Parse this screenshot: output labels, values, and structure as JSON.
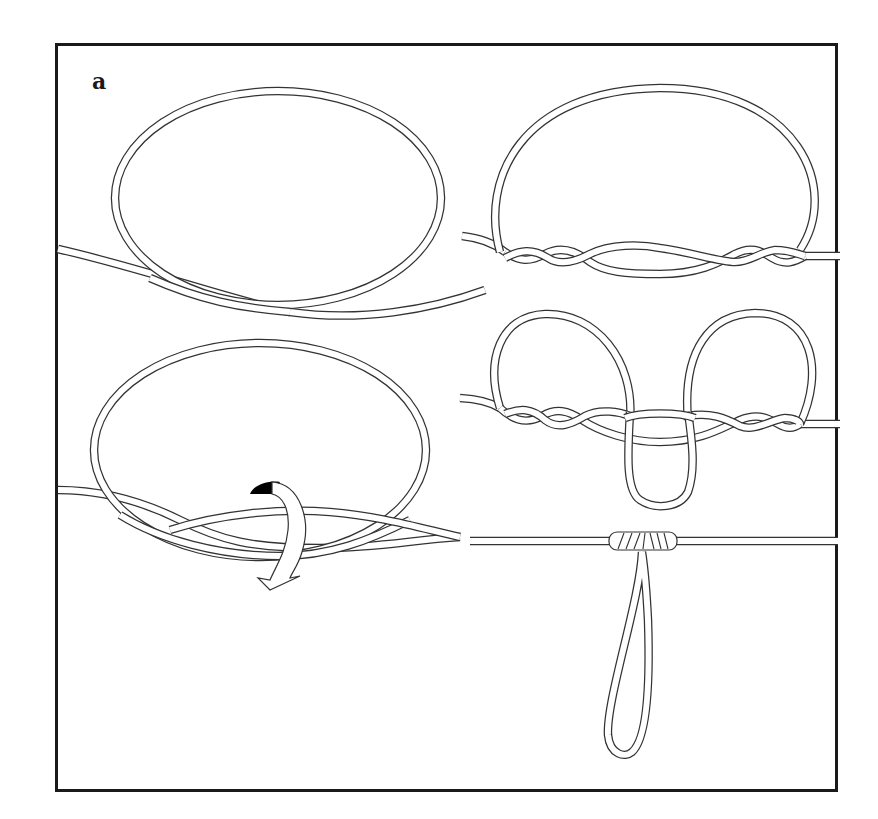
{
  "figure": {
    "panel_label": "a",
    "colors": {
      "frame": "#1a1a1a",
      "rope_outline": "#333333",
      "rope_fill": "#ffffff",
      "arrow_fill": "#ffffff",
      "arrow_head_shade": "#000000",
      "background": "#ffffff"
    },
    "steps": [
      {
        "id": 1,
        "position": "top-left",
        "description": "Form a large loop in the line"
      },
      {
        "id": 2,
        "position": "bottom-left",
        "description": "Twist the loop around the standing line (rotation arrow)"
      },
      {
        "id": 3,
        "position": "top-right",
        "description": "Line wrapped with multiple twists on each side"
      },
      {
        "id": 4,
        "position": "middle-right",
        "description": "Pull loop center down through middle opening"
      },
      {
        "id": 5,
        "position": "bottom-right",
        "description": "Tightened knot with hanging dropper loop"
      }
    ],
    "annotations": {
      "rotation_arrow": "curved-arrow indicating twist direction"
    }
  }
}
